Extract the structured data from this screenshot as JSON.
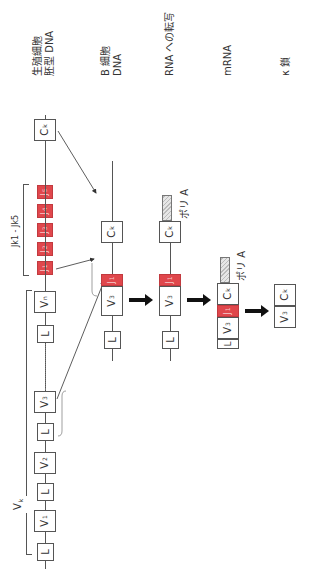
{
  "rows": {
    "germline": {
      "label_line1": "生殖細胞",
      "label_line2": "胚型 DNA"
    },
    "bcell": {
      "label_line1": "B 細胞",
      "label_line2": "DNA"
    },
    "rna": {
      "label": "RNA への転写"
    },
    "mrna": {
      "label": "mRNA"
    },
    "kappa": {
      "label": "κ 鎖"
    }
  },
  "segments": {
    "L": "L",
    "V1": "V",
    "V1_sub": "1",
    "V2": "V",
    "V2_sub": "2",
    "V3": "V",
    "V3_sub": "3",
    "Vn": "V",
    "Vn_sub": "n",
    "J1": "J",
    "J1_sub": "1",
    "J2": "J",
    "J2_sub": "2",
    "J3": "J",
    "J3_sub": "3",
    "J4": "J",
    "J4_sub": "4",
    "J5": "J",
    "J5_sub": "5",
    "C": "C",
    "C_sub": "k"
  },
  "brackets": {
    "v_cluster": "V",
    "v_cluster_sub": "k",
    "j_cluster": "Jk1 - Jk5"
  },
  "polyA": "ポリ A",
  "colors": {
    "j_segment": "#e0474c",
    "line": "#555555",
    "arrow": "#111111"
  }
}
